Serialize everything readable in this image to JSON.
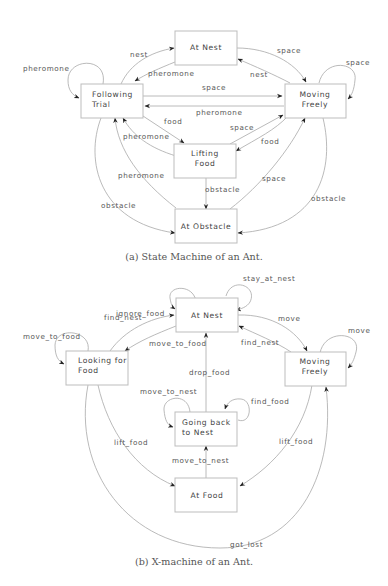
{
  "figure_a": {
    "caption": "(a) State Machine of an Ant.",
    "states": {
      "at_nest": [
        "At Nest"
      ],
      "following_trial": [
        "Following",
        "Trial"
      ],
      "moving_freely": [
        "Moving",
        "Freely"
      ],
      "lifting_food": [
        "Lifting",
        "Food"
      ],
      "at_obstacle": [
        "At Obstacle"
      ]
    },
    "transitions": [
      {
        "from": "Following Trial",
        "to": "Following Trial",
        "label": "pheromone"
      },
      {
        "from": "Following Trial",
        "to": "At Nest",
        "label": "nest"
      },
      {
        "from": "At Nest",
        "to": "Following Trial",
        "label": "pheromone"
      },
      {
        "from": "At Nest",
        "to": "Moving Freely",
        "label": "space"
      },
      {
        "from": "Moving Freely",
        "to": "At Nest",
        "label": "nest"
      },
      {
        "from": "Moving Freely",
        "to": "Moving Freely",
        "label": "space"
      },
      {
        "from": "Following Trial",
        "to": "Moving Freely",
        "label": "space"
      },
      {
        "from": "Moving Freely",
        "to": "Following Trial",
        "label": "pheromone"
      },
      {
        "from": "Following Trial",
        "to": "Lifting Food",
        "label": "food"
      },
      {
        "from": "Lifting Food",
        "to": "Following Trial",
        "label": "pheromone"
      },
      {
        "from": "Lifting Food",
        "to": "Moving Freely",
        "label": "space"
      },
      {
        "from": "Moving Freely",
        "to": "Lifting Food",
        "label": "food"
      },
      {
        "from": "At Obstacle",
        "to": "Following Trial",
        "label": "pheromone"
      },
      {
        "from": "Lifting Food",
        "to": "At Obstacle",
        "label": "obstacle"
      },
      {
        "from": "At Obstacle",
        "to": "Moving Freely",
        "label": "space"
      },
      {
        "from": "Following Trial",
        "to": "At Obstacle",
        "label": "obstacle"
      },
      {
        "from": "Moving Freely",
        "to": "At Obstacle",
        "label": "obstacle"
      }
    ],
    "labels": {
      "pheromone_self": "pheromone",
      "nest_ft_an": "nest",
      "pheromone_an_ft": "pheromone",
      "space_an_mf": "space",
      "nest_mf_an": "nest",
      "space_self": "space",
      "space_ft_mf": "space",
      "pheromone_mf_ft": "pheromone",
      "food_ft_lf": "food",
      "pheromone_lf_ft": "pheromone",
      "space_lf_mf": "space",
      "food_mf_lf": "food",
      "pheromone_ao_ft": "pheromone",
      "obstacle_lf_ao": "obstacle",
      "space_ao_mf": "space",
      "obstacle_ft_ao": "obstacle",
      "obstacle_mf_ao": "obstacle"
    }
  },
  "figure_b": {
    "caption": "(b) X-machine of an Ant.",
    "states": {
      "at_nest": [
        "At Nest"
      ],
      "looking_for_food": [
        "Looking for",
        "Food"
      ],
      "moving_freely": [
        "Moving",
        "Freely"
      ],
      "going_back_to_nest": [
        "Going back",
        "to Nest"
      ],
      "at_food": [
        "At Food"
      ]
    },
    "transitions": [
      {
        "from": "Looking for Food",
        "to": "Looking for Food",
        "label": "move_to_food"
      },
      {
        "from": "At Nest",
        "to": "At Nest",
        "label": "ignore_food"
      },
      {
        "from": "At Nest",
        "to": "At Nest",
        "label": "stay_at_nest"
      },
      {
        "from": "Looking for Food",
        "to": "At Nest",
        "label": "find_nest"
      },
      {
        "from": "At Nest",
        "to": "Looking for Food",
        "label": "move_to_food"
      },
      {
        "from": "At Nest",
        "to": "Moving Freely",
        "label": "move"
      },
      {
        "from": "Moving Freely",
        "to": "At Nest",
        "label": "find_nest"
      },
      {
        "from": "Moving Freely",
        "to": "Moving Freely",
        "label": "move"
      },
      {
        "from": "Going back to Nest",
        "to": "At Nest",
        "label": "drop_food"
      },
      {
        "from": "Going back to Nest",
        "to": "Going back to Nest",
        "label": "move_to_nest"
      },
      {
        "from": "Going back to Nest",
        "to": "Going back to Nest",
        "label": "find_food"
      },
      {
        "from": "Looking for Food",
        "to": "At Food",
        "label": "lift_food"
      },
      {
        "from": "Moving Freely",
        "to": "At Food",
        "label": "lift_food"
      },
      {
        "from": "At Food",
        "to": "Going back to Nest",
        "label": "move_to_nest"
      },
      {
        "from": "Looking for Food",
        "to": "Moving Freely",
        "label": "got_lost"
      }
    ],
    "labels": {
      "ignore_food": "ignore_food",
      "stay_at_nest": "stay_at_nest",
      "find_nest_lf_an": "find_nest",
      "move_to_food_self": "move_to_food",
      "move_to_food_an_lf": "move_to_food",
      "move": "move",
      "move_self": "move",
      "find_nest_mf_an": "find_nest",
      "drop_food": "drop_food",
      "move_to_nest_self": "move_to_nest",
      "find_food": "find_food",
      "lift_food_lf": "lift_food",
      "lift_food_mf": "lift_food",
      "move_to_nest_af": "move_to_nest",
      "got_lost": "got_lost"
    }
  }
}
